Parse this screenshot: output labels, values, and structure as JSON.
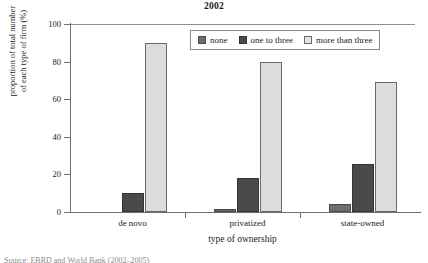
{
  "chart_data": {
    "type": "bar",
    "title": "2002",
    "xlabel": "type of ownership",
    "ylabel_line1": "proportion of total number",
    "ylabel_line2": "of each type of firm (%)",
    "categories": [
      "de novo",
      "privatized",
      "state-owned"
    ],
    "ylim": [
      0,
      100
    ],
    "yticks": [
      0,
      20,
      40,
      60,
      80,
      100
    ],
    "grid": false,
    "legend_position": "top-right inside",
    "series": [
      {
        "name": "none",
        "color": "#6d6d6d",
        "values": [
          0,
          1.5,
          4
        ]
      },
      {
        "name": "one to three",
        "color": "#4a4a4a",
        "values": [
          10,
          18,
          25.5
        ]
      },
      {
        "name": "more than three",
        "color": "#dcdcdc",
        "values": [
          90,
          80,
          69
        ]
      }
    ]
  },
  "ytick_labels": [
    "0",
    "20",
    "40",
    "60",
    "80",
    "100"
  ],
  "legend": {
    "items": [
      {
        "label": "none"
      },
      {
        "label": "one to three"
      },
      {
        "label": "more than three"
      }
    ]
  },
  "caption": "Source: EBRD and World Bank (2002–2005)"
}
